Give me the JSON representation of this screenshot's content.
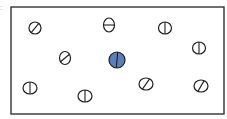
{
  "stray_mark": ":",
  "frame": {
    "x": 11,
    "y": 7,
    "width": 213,
    "height": 107,
    "stroke": "#333333",
    "stroke_width": 1.4
  },
  "colors": {
    "outline": "#1e1e1e",
    "highlight_fill": "#5b7fb8",
    "default_fill": "#ffffff"
  },
  "circles": [
    {
      "id": "c1",
      "cx": 35,
      "cy": 28,
      "rx": 6,
      "ry": 6,
      "line_angle": 40,
      "highlighted": false
    },
    {
      "id": "c2",
      "cx": 109,
      "cy": 25,
      "rx": 5.5,
      "ry": 7,
      "line_angle": 90,
      "highlighted": false
    },
    {
      "id": "c3",
      "cx": 165,
      "cy": 28,
      "rx": 6.5,
      "ry": 6,
      "line_angle": 0,
      "highlighted": false
    },
    {
      "id": "c4",
      "cx": 199,
      "cy": 48,
      "rx": 6.5,
      "ry": 6,
      "line_angle": 0,
      "highlighted": false
    },
    {
      "id": "c5",
      "cx": 65,
      "cy": 58,
      "rx": 5.5,
      "ry": 6.5,
      "line_angle": 50,
      "highlighted": false
    },
    {
      "id": "c6",
      "cx": 117,
      "cy": 60,
      "rx": 8,
      "ry": 8,
      "line_angle": 5,
      "highlighted": true
    },
    {
      "id": "c7",
      "cx": 30,
      "cy": 88,
      "rx": 7,
      "ry": 6,
      "line_angle": 0,
      "highlighted": false
    },
    {
      "id": "c8",
      "cx": 85,
      "cy": 96,
      "rx": 7,
      "ry": 6,
      "line_angle": 0,
      "highlighted": false
    },
    {
      "id": "c9",
      "cx": 146,
      "cy": 84,
      "rx": 7,
      "ry": 6,
      "line_angle": 35,
      "highlighted": false
    },
    {
      "id": "c10",
      "cx": 201,
      "cy": 86,
      "rx": 7,
      "ry": 6,
      "line_angle": 30,
      "highlighted": false
    }
  ]
}
